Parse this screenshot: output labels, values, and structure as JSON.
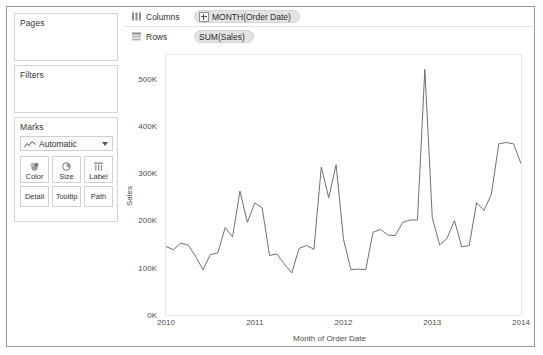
{
  "cards": {
    "pages": {
      "title": "Pages"
    },
    "filters": {
      "title": "Filters"
    },
    "marks": {
      "title": "Marks",
      "type_label": "Automatic",
      "type_icon": "line-chart-icon",
      "buttons": [
        {
          "label": "Color",
          "icon": "color-palette-icon"
        },
        {
          "label": "Size",
          "icon": "size-circle-icon"
        },
        {
          "label": "Label",
          "icon": "label-text-icon"
        },
        {
          "label": "Detail",
          "icon": "detail-icon"
        },
        {
          "label": "Tooltip",
          "icon": "tooltip-icon"
        },
        {
          "label": "Path",
          "icon": "path-icon"
        }
      ]
    }
  },
  "shelves": {
    "columns": {
      "label": "Columns",
      "icon": "columns-icon",
      "pill": "MONTH(Order Date)",
      "pill_expandable": true
    },
    "rows": {
      "label": "Rows",
      "icon": "rows-icon",
      "pill": "SUM(Sales)",
      "pill_expandable": false
    }
  },
  "colors": {
    "line": "#6f6f77",
    "pill_bg": "#e3e3e3",
    "panel_border": "#d4d4d4",
    "window_border": "#9a9a9a",
    "axis_text": "#4d4d4d"
  },
  "chart_data": {
    "type": "line",
    "title": "",
    "xlabel": "Month of Order Date",
    "ylabel": "Sales",
    "grid": false,
    "legend": null,
    "ylim": [
      0,
      550000
    ],
    "ytick_labels": [
      "0K",
      "100K",
      "200K",
      "300K",
      "400K",
      "500K"
    ],
    "ytick_values": [
      0,
      100000,
      200000,
      300000,
      400000,
      500000
    ],
    "xtick_labels": [
      "2010",
      "2011",
      "2012",
      "2013",
      "2014"
    ],
    "xtick_values": [
      "2010-01",
      "2011-01",
      "2012-01",
      "2013-01",
      "2014-01"
    ],
    "xlim": [
      "2010-01",
      "2014-01"
    ],
    "series": [
      {
        "name": "SUM(Sales)",
        "x": [
          "2010-01",
          "2010-02",
          "2010-03",
          "2010-04",
          "2010-05",
          "2010-06",
          "2010-07",
          "2010-08",
          "2010-09",
          "2010-10",
          "2010-11",
          "2010-12",
          "2011-01",
          "2011-02",
          "2011-03",
          "2011-04",
          "2011-05",
          "2011-06",
          "2011-07",
          "2011-08",
          "2011-09",
          "2011-10",
          "2011-11",
          "2011-12",
          "2012-01",
          "2012-02",
          "2012-03",
          "2012-04",
          "2012-05",
          "2012-06",
          "2012-07",
          "2012-08",
          "2012-09",
          "2012-10",
          "2012-11",
          "2012-12",
          "2013-01",
          "2013-02",
          "2013-03",
          "2013-04",
          "2013-05",
          "2013-06",
          "2013-07",
          "2013-08",
          "2013-09",
          "2013-10",
          "2013-11",
          "2013-12",
          "2014-01"
        ],
        "values": [
          145000,
          138000,
          152000,
          148000,
          124000,
          96000,
          128000,
          131000,
          185000,
          165000,
          262000,
          196000,
          237000,
          227000,
          126000,
          129000,
          108000,
          89000,
          141000,
          147000,
          139000,
          313000,
          248000,
          318000,
          160000,
          96000,
          97000,
          96000,
          175000,
          181000,
          169000,
          168000,
          196000,
          201000,
          201000,
          520000,
          206000,
          148000,
          162000,
          200000,
          144000,
          147000,
          238000,
          221000,
          256000,
          362000,
          365000,
          362000,
          320000
        ]
      }
    ]
  }
}
